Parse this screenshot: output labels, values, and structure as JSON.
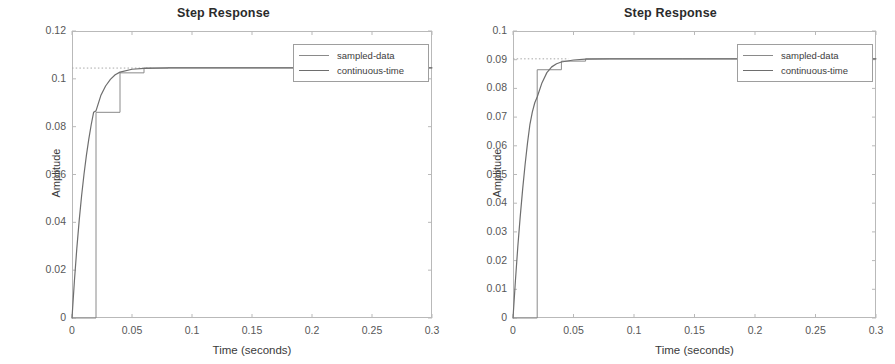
{
  "figures": [
    {
      "title": "Step Response",
      "xlabel": "Time (seconds)",
      "ylabel": "Amplitude",
      "legend": {
        "sampled": "sampled-data",
        "continuous": "continuous-time"
      },
      "yticks": [
        "0",
        "0.02",
        "0.04",
        "0.06",
        "0.08",
        "0.1",
        "0.12"
      ],
      "xticks": [
        "0",
        "0.05",
        "0.1",
        "0.15",
        "0.2",
        "0.25",
        "0.3"
      ]
    },
    {
      "title": "Step Response",
      "xlabel": "Time (seconds)",
      "ylabel": "Amplitude",
      "legend": {
        "sampled": "sampled-data",
        "continuous": "continuous-time"
      },
      "yticks": [
        "0",
        "0.01",
        "0.02",
        "0.03",
        "0.04",
        "0.05",
        "0.06",
        "0.07",
        "0.08",
        "0.09",
        "0.1"
      ],
      "xticks": [
        "0",
        "0.05",
        "0.1",
        "0.15",
        "0.2",
        "0.25",
        "0.3"
      ]
    }
  ],
  "colors": {
    "continuous_line": "#6e6e6e",
    "sampled_line": "#8a8a8a",
    "reference_dotted": "#a8a8a8",
    "axis": "#b9b9b9",
    "text": "#3a3a3a"
  },
  "chart_data": [
    {
      "type": "line",
      "title": "Step Response",
      "xlabel": "Time (seconds)",
      "ylabel": "Amplitude",
      "xlim": [
        0,
        0.3
      ],
      "ylim": [
        0,
        0.12
      ],
      "xticks": [
        0,
        0.05,
        0.1,
        0.15,
        0.2,
        0.25,
        0.3
      ],
      "yticks": [
        0,
        0.02,
        0.04,
        0.06,
        0.08,
        0.1,
        0.12
      ],
      "grid": false,
      "legend_position": "top-right",
      "annotations": [
        {
          "kind": "horizontal-dotted-reference",
          "y": 0.1045,
          "x_from": 0.0,
          "x_to": 0.068,
          "label": "steady-state"
        }
      ],
      "series": [
        {
          "name": "sampled-data",
          "style": "staircase",
          "sample_time": 0.02,
          "x": [
            0,
            0.02,
            0.04,
            0.06,
            0.08,
            0.1,
            0.12,
            0.14,
            0.16,
            0.18,
            0.2,
            0.22,
            0.24,
            0.26,
            0.28,
            0.3
          ],
          "values": [
            0,
            0.086,
            0.1025,
            0.1045,
            0.1046,
            0.1046,
            0.1046,
            0.1046,
            0.1046,
            0.1046,
            0.1046,
            0.1046,
            0.1046,
            0.1046,
            0.1046,
            0.1046
          ]
        },
        {
          "name": "continuous-time",
          "style": "solid",
          "x": [
            0,
            0.002,
            0.004,
            0.006,
            0.008,
            0.01,
            0.012,
            0.014,
            0.016,
            0.018,
            0.02,
            0.024,
            0.028,
            0.032,
            0.036,
            0.04,
            0.05,
            0.06,
            0.08,
            0.1,
            0.15,
            0.2,
            0.25,
            0.3
          ],
          "values": [
            0,
            0.0155,
            0.029,
            0.0408,
            0.0511,
            0.0601,
            0.068,
            0.0748,
            0.0808,
            0.086,
            0.0866,
            0.093,
            0.097,
            0.0998,
            0.1017,
            0.1028,
            0.104,
            0.1044,
            0.1046,
            0.1046,
            0.1046,
            0.1046,
            0.1046,
            0.1046
          ]
        }
      ]
    },
    {
      "type": "line",
      "title": "Step Response",
      "xlabel": "Time (seconds)",
      "ylabel": "Amplitude",
      "xlim": [
        0,
        0.3
      ],
      "ylim": [
        0,
        0.1
      ],
      "xticks": [
        0,
        0.05,
        0.1,
        0.15,
        0.2,
        0.25,
        0.3
      ],
      "yticks": [
        0,
        0.01,
        0.02,
        0.03,
        0.04,
        0.05,
        0.06,
        0.07,
        0.08,
        0.09,
        0.1
      ],
      "grid": false,
      "legend_position": "top-right",
      "annotations": [
        {
          "kind": "horizontal-dotted-reference",
          "y": 0.0903,
          "x_from": 0.0,
          "x_to": 0.046,
          "label": "steady-state"
        }
      ],
      "series": [
        {
          "name": "sampled-data",
          "style": "staircase",
          "sample_time": 0.02,
          "x": [
            0,
            0.02,
            0.04,
            0.06,
            0.08,
            0.1,
            0.12,
            0.14,
            0.16,
            0.18,
            0.2,
            0.22,
            0.24,
            0.26,
            0.28,
            0.3
          ],
          "values": [
            0,
            0.0865,
            0.0895,
            0.0903,
            0.0903,
            0.0903,
            0.0903,
            0.0903,
            0.0903,
            0.0903,
            0.0903,
            0.0903,
            0.0903,
            0.0903,
            0.0903,
            0.0903
          ]
        },
        {
          "name": "continuous-time",
          "style": "solid",
          "x": [
            0,
            0.002,
            0.004,
            0.006,
            0.008,
            0.01,
            0.012,
            0.014,
            0.016,
            0.018,
            0.02,
            0.024,
            0.028,
            0.032,
            0.036,
            0.04,
            0.05,
            0.06,
            0.08,
            0.1,
            0.15,
            0.2,
            0.25,
            0.3
          ],
          "values": [
            0,
            0.013,
            0.025,
            0.0355,
            0.045,
            0.0535,
            0.061,
            0.0675,
            0.0718,
            0.075,
            0.077,
            0.082,
            0.0855,
            0.0875,
            0.0886,
            0.0892,
            0.0899,
            0.0902,
            0.0903,
            0.0903,
            0.0903,
            0.0903,
            0.0903,
            0.0903
          ]
        }
      ]
    }
  ]
}
